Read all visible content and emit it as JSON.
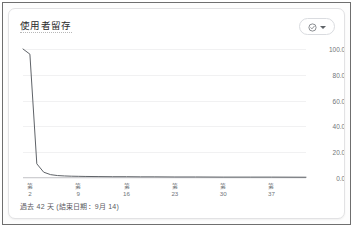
{
  "card": {
    "title": "使用者留存",
    "footer": "過去 42 天 (結束日期：9月 14)"
  },
  "header_control": {
    "status_icon": "check-circle-icon",
    "menu_icon": "chevron-down-icon",
    "accent_color": "#5f6368",
    "border_color": "#dadce0"
  },
  "chart_data": {
    "type": "line",
    "title": "使用者留存",
    "xlabel": "",
    "ylabel": "",
    "grid": true,
    "legend": false,
    "line_color": "#5f6368",
    "ylim": [
      0,
      100
    ],
    "ytick_labels": [
      "100.0%",
      "80.0%",
      "60.0%",
      "40.0%",
      "20.0%",
      "0.0%"
    ],
    "ytick_values": [
      100,
      80,
      60,
      40,
      20,
      0
    ],
    "xtick_prefix": "第",
    "xtick_labels": [
      "2",
      "9",
      "16",
      "23",
      "30",
      "37"
    ],
    "xtick_values": [
      2,
      9,
      16,
      23,
      30,
      37
    ],
    "xlim": [
      1,
      42
    ],
    "x": [
      1,
      2,
      3,
      4,
      5,
      6,
      7,
      8,
      9,
      10,
      12,
      14,
      16,
      18,
      20,
      23,
      26,
      30,
      34,
      37,
      42
    ],
    "values": [
      100.0,
      96.0,
      11.0,
      4.5,
      2.6,
      1.9,
      1.6,
      1.4,
      1.3,
      1.2,
      1.1,
      1.0,
      1.0,
      0.9,
      0.9,
      0.8,
      0.8,
      0.7,
      0.7,
      0.7,
      0.6
    ],
    "series": [
      {
        "name": "使用者留存",
        "values": [
          100.0,
          96.0,
          11.0,
          4.5,
          2.6,
          1.9,
          1.6,
          1.4,
          1.3,
          1.2,
          1.1,
          1.0,
          1.0,
          0.9,
          0.9,
          0.8,
          0.8,
          0.7,
          0.7,
          0.7,
          0.6
        ]
      }
    ]
  }
}
